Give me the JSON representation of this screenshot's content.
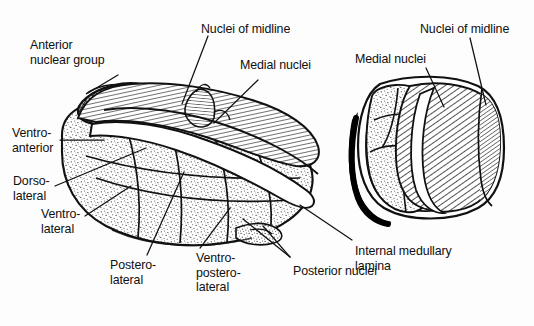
{
  "figure": {
    "colors": {
      "ink": "#111111",
      "background": "#fdfdfd",
      "stipple": "#2b2b2b",
      "hatch": "#1a1a1a",
      "shadow": "#000000"
    }
  },
  "labels": {
    "anterior_nuclear_group": "Anterior\nnuclear group",
    "ventro_anterior": "Ventro-\nanterior",
    "dorso_lateral": "Dorso-\nlateral",
    "ventro_lateral": "Ventro-\nlateral",
    "postero_lateral": "Postero-\nlateral",
    "ventro_postero_lateral": "Ventro-\npostero-\nlateral",
    "nuclei_of_midline_left": "Nuclei of midline",
    "medial_nuclei_left": "Medial nuclei",
    "nuclei_of_midline_right": "Nuclei of midline",
    "medial_nuclei_right": "Medial nuclei",
    "posterior_nuclei": "Posterior nuclei",
    "internal_medullary_lamina": "Internal medullary\nlamina"
  },
  "leaders": [
    {
      "name": "leader-anterior-nuclear-group",
      "from": [
        118,
        75
      ],
      "to": [
        88,
        93
      ]
    },
    {
      "name": "leader-ventro-anterior",
      "from": [
        60,
        140
      ],
      "to": [
        104,
        140
      ]
    },
    {
      "name": "leader-dorso-lateral",
      "from": [
        55,
        186
      ],
      "to": [
        146,
        148
      ]
    },
    {
      "name": "leader-ventro-lateral",
      "from": [
        85,
        216
      ],
      "to": [
        131,
        186
      ]
    },
    {
      "name": "leader-postero-lateral",
      "from": [
        147,
        255
      ],
      "to": [
        184,
        172
      ]
    },
    {
      "name": "leader-ventro-postero-lateral",
      "from": [
        200,
        248
      ],
      "to": [
        230,
        208
      ]
    },
    {
      "name": "leader-nuclei-midline-left",
      "from": [
        208,
        36
      ],
      "to": [
        182,
        104
      ]
    },
    {
      "name": "leader-medial-nuclei-left",
      "from": [
        258,
        80
      ],
      "to": [
        214,
        123
      ]
    },
    {
      "name": "leader-posterior-nuclei-a",
      "from": [
        290,
        257
      ],
      "to": [
        243,
        219
      ]
    },
    {
      "name": "leader-posterior-nuclei-b",
      "from": [
        290,
        257
      ],
      "to": [
        263,
        226
      ]
    },
    {
      "name": "leader-internal-medullary-lamina",
      "from": [
        352,
        240
      ],
      "to": [
        300,
        205
      ]
    },
    {
      "name": "leader-medial-nuclei-right",
      "from": [
        426,
        68
      ],
      "to": [
        444,
        107
      ]
    },
    {
      "name": "leader-nuclei-midline-right",
      "from": [
        470,
        38
      ],
      "to": [
        486,
        105
      ]
    }
  ]
}
